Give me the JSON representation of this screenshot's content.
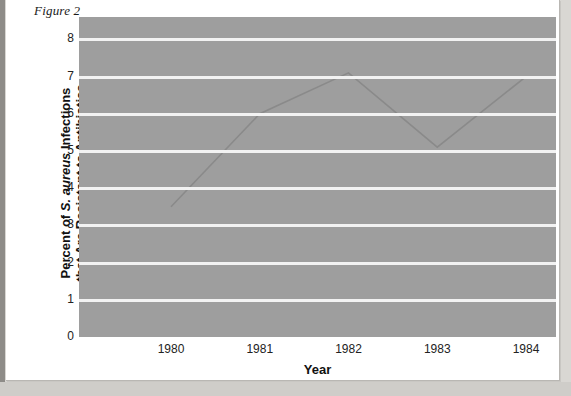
{
  "figure": {
    "caption": "Figure 2"
  },
  "chart_data": {
    "type": "line",
    "title": "",
    "xlabel": "Year",
    "ylabel_parts": {
      "line1_pre": "Percent of ",
      "line1_italic": "S. aureus",
      "line1_post": " Infections",
      "line2": "that Are Resistant to Antibiotics"
    },
    "ylabel": "Percent of S. aureus Infections that Are Resistant to Antibiotics",
    "categories": [
      "1980",
      "1981",
      "1982",
      "1983",
      "1984"
    ],
    "x": [
      1980,
      1981,
      1982,
      1983,
      1984
    ],
    "values": [
      3.5,
      6.0,
      7.1,
      5.1,
      7.0
    ],
    "series": [
      {
        "name": "Percent resistant",
        "values": [
          3.5,
          6.0,
          7.1,
          5.1,
          7.0
        ]
      }
    ],
    "ylim": [
      0,
      8.6
    ],
    "yticks": [
      0,
      1,
      2,
      3,
      4,
      5,
      6,
      7,
      8
    ],
    "ytick_labels": [
      "0",
      "1",
      "2",
      "3",
      "4",
      "5",
      "6",
      "7",
      "8"
    ],
    "xtick_labels": [
      "1980",
      "1981",
      "1982",
      "1983",
      "1984"
    ],
    "grid": true,
    "grid_color": "#f2f2f2",
    "plot_background": "#9e9e9e",
    "line_color": "#8a8a8a",
    "legend": null,
    "legend_position": "none"
  }
}
